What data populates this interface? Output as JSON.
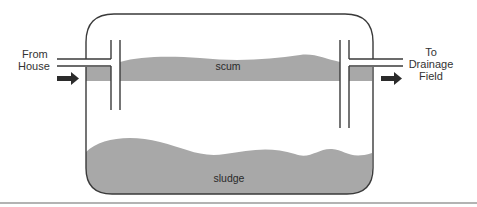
{
  "diagram": {
    "labels": {
      "inlet_line1": "From",
      "inlet_line2": "House",
      "outlet_line1": "To",
      "outlet_line2": "Drainage",
      "outlet_line3": "Field",
      "scum": "scum",
      "sludge": "sludge"
    },
    "colors": {
      "outline": "#3a3a3a",
      "layer_fill": "#a8a8a8",
      "arrow": "#2b2b2b",
      "separator": "#9a9a9a"
    }
  }
}
